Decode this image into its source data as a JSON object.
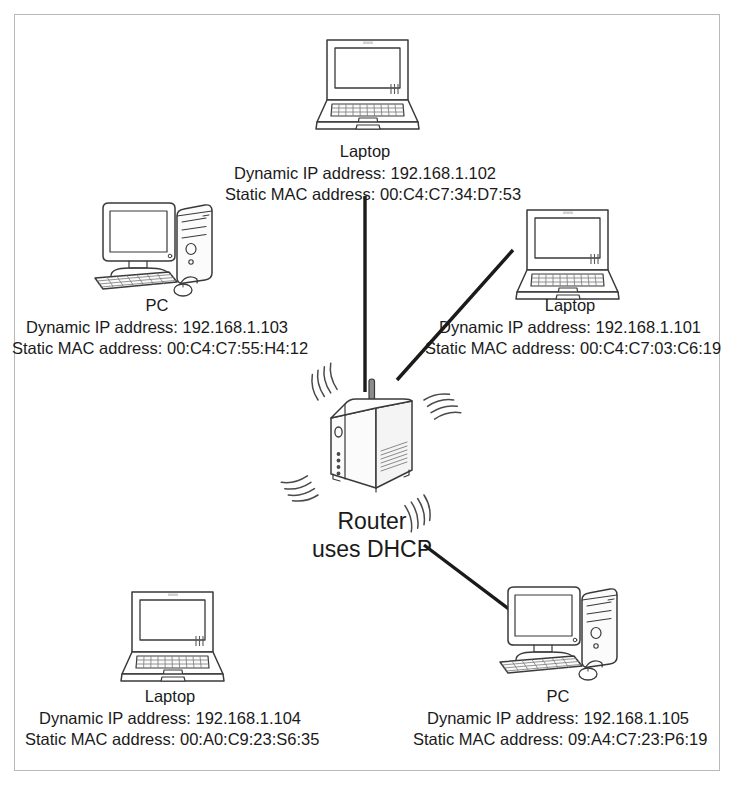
{
  "diagram": {
    "background_color": "#ffffff",
    "border_color": "#b9b9b9",
    "line_color": "#1a1a1a",
    "text_color": "#1a1a1a",
    "labels": {
      "dynamic_ip_prefix": "Dynamic IP address: ",
      "static_mac_prefix": "Static MAC address: "
    }
  },
  "router": {
    "name": "Router",
    "subtitle": "uses DHCP",
    "icon": "wireless-router-icon",
    "led_count": 4,
    "wave_count": 4
  },
  "nodes": [
    {
      "id": "laptop-top",
      "type": "Laptop",
      "icon": "laptop-icon",
      "dynamic_ip": "192.168.1.102",
      "static_mac": "00:C4:C7:34:D7:53",
      "ip_line": "Dynamic IP address: 192.168.1.102",
      "mac_line": "Static MAC address: 00:C4:C7:34:D7:53",
      "wired": true
    },
    {
      "id": "pc-left",
      "type": "PC",
      "icon": "desktop-pc-icon",
      "dynamic_ip": "192.168.1.103",
      "static_mac": "00:C4:C7:55:H4:12",
      "ip_line": "Dynamic IP address: 192.168.1.103",
      "mac_line": "Static MAC address: 00:C4:C7:55:H4:12",
      "wired": false
    },
    {
      "id": "laptop-right",
      "type": "Laptop",
      "icon": "laptop-icon",
      "dynamic_ip": "192.168.1.101",
      "static_mac": "00:C4:C7:03:C6:19",
      "ip_line": "Dynamic IP address: 192.168.1.101",
      "mac_line": "Static MAC address: 00:C4:C7:03:C6:19",
      "wired": true
    },
    {
      "id": "laptop-bottom-left",
      "type": "Laptop",
      "icon": "laptop-icon",
      "dynamic_ip": "192.168.1.104",
      "static_mac": "00:A0:C9:23:S6:35",
      "ip_line": "Dynamic IP address: 192.168.1.104",
      "mac_line": "Static MAC address: 00:A0:C9:23:S6:35",
      "wired": false
    },
    {
      "id": "pc-bottom-right",
      "type": "PC",
      "icon": "desktop-pc-icon",
      "dynamic_ip": "192.168.1.105",
      "static_mac": "09:A4:C7:23:P6:19",
      "ip_line": "Dynamic IP address: 192.168.1.105",
      "mac_line": "Static MAC address: 09:A4:C7:23:P6:19",
      "wired": true
    }
  ]
}
